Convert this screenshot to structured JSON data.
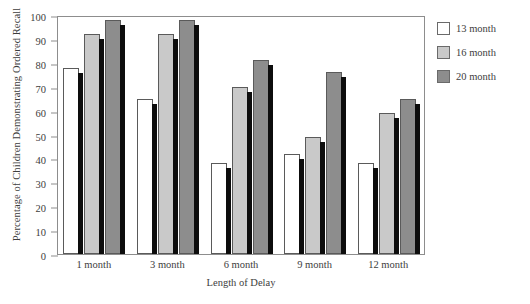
{
  "chart_data": {
    "type": "bar",
    "title": "",
    "xlabel": "Length of Delay",
    "ylabel": "Percentage of Children Demonstrating Ordered Recall",
    "categories": [
      "1 month",
      "3 month",
      "6 month",
      "9 month",
      "12 month"
    ],
    "series": [
      {
        "name": "13 month",
        "color": "#ffffff",
        "values": [
          78,
          65,
          38,
          42,
          38
        ]
      },
      {
        "name": "16 month",
        "color": "#c9c9c9",
        "values": [
          92,
          92,
          70,
          49,
          59
        ]
      },
      {
        "name": "20 month",
        "color": "#8d8d8d",
        "values": [
          98,
          98,
          81,
          76,
          65
        ]
      }
    ],
    "ylim": [
      0,
      100
    ],
    "ytick_values": [
      0,
      10,
      20,
      30,
      40,
      50,
      60,
      70,
      80,
      90,
      100
    ],
    "ytick_labels": [
      "0",
      "10",
      "20",
      "30",
      "40",
      "50",
      "60",
      "70",
      "80",
      "90",
      "100"
    ],
    "grid": false,
    "legend_position": "top-right",
    "legend_entries": [
      "13 month",
      "16 month",
      "20 month"
    ]
  }
}
